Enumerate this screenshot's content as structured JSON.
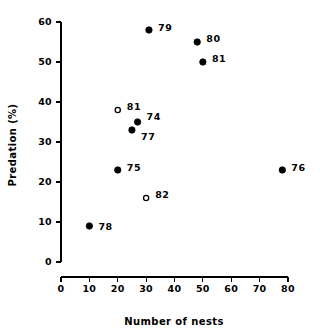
{
  "chart_data": {
    "type": "scatter",
    "title": "",
    "xlabel": "Number of nests",
    "ylabel": "Predation (%)",
    "xlim": [
      0,
      80
    ],
    "ylim": [
      0,
      60
    ],
    "xticks": [
      0,
      10,
      20,
      30,
      40,
      50,
      60,
      70,
      80
    ],
    "yticks": [
      0,
      10,
      20,
      30,
      40,
      50,
      60
    ],
    "xticklabels": [
      "0",
      "10",
      "20",
      "30",
      "40",
      "50",
      "60",
      "70",
      "80"
    ],
    "yticklabels": [
      "0",
      "10",
      "20",
      "30",
      "40",
      "50",
      "60"
    ],
    "grid": false,
    "legend": false,
    "series": [
      {
        "name": "filled",
        "marker": "filled-circle",
        "color": "#000000",
        "points": [
          {
            "label": "78",
            "x": 10,
            "y": 9,
            "label_dx": 9,
            "label_dy": 1
          },
          {
            "label": "75",
            "x": 20,
            "y": 23,
            "label_dx": 9,
            "label_dy": -2
          },
          {
            "label": "77",
            "x": 25,
            "y": 33,
            "label_dx": 9,
            "label_dy": 7
          },
          {
            "label": "74",
            "x": 27,
            "y": 35,
            "label_dx": 9,
            "label_dy": -5
          },
          {
            "label": "79",
            "x": 31,
            "y": 58,
            "label_dx": 9,
            "label_dy": -2
          },
          {
            "label": "80",
            "x": 48,
            "y": 55,
            "label_dx": 9,
            "label_dy": -3
          },
          {
            "label": "81",
            "x": 50,
            "y": 50,
            "label_dx": 9,
            "label_dy": -3
          },
          {
            "label": "76",
            "x": 78,
            "y": 23,
            "label_dx": 9,
            "label_dy": -2
          }
        ]
      },
      {
        "name": "open",
        "marker": "open-circle",
        "color": "#000000",
        "points": [
          {
            "label": "81",
            "x": 20,
            "y": 38,
            "label_dx": 9,
            "label_dy": -3
          },
          {
            "label": "82",
            "x": 30,
            "y": 16,
            "label_dx": 9,
            "label_dy": -3
          }
        ]
      }
    ]
  },
  "axes": {
    "x_title": "Number of nests",
    "y_title": "Predation (%)"
  }
}
